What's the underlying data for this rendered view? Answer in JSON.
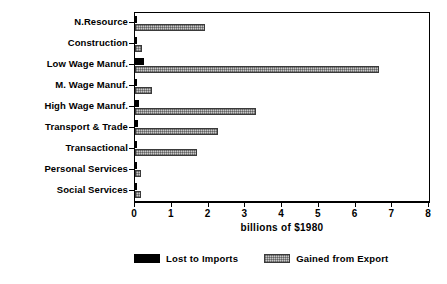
{
  "chart_data": {
    "type": "bar",
    "orientation": "horizontal",
    "title": "",
    "xlabel": "billions of $1980",
    "ylabel": "",
    "xlim": [
      0,
      8
    ],
    "xticks": [
      "0",
      "1",
      "2",
      "3",
      "4",
      "5",
      "6",
      "7",
      "8"
    ],
    "grid": false,
    "legend_position": "bottom",
    "categories": [
      "N.Resource",
      "Construction",
      "Low Wage Manuf.",
      "M. Wage Manuf.",
      "High Wage Manuf.",
      "Transport & Trade",
      "Transactional",
      "Personal Services",
      "Social Services"
    ],
    "series": [
      {
        "name": "Lost to Imports",
        "color": "#000000",
        "values": [
          0.06,
          0.02,
          0.25,
          0.04,
          0.1,
          0.07,
          0.05,
          0.02,
          0.02
        ]
      },
      {
        "name": "Gained from Export",
        "color": "#c9c9c9",
        "values": [
          1.9,
          0.19,
          6.65,
          0.47,
          3.3,
          2.25,
          1.68,
          0.15,
          0.17
        ]
      }
    ]
  },
  "legend": {
    "items": [
      {
        "label": "Lost to Imports",
        "swatch": "black-solid"
      },
      {
        "label": "Gained from Export",
        "swatch": "gray-hatched"
      }
    ]
  }
}
